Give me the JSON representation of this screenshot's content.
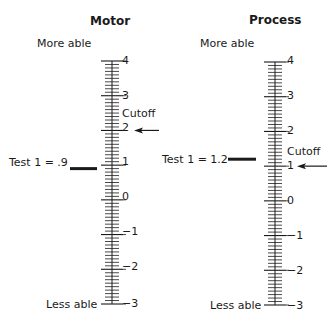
{
  "panels": [
    {
      "title": "Motor",
      "top_label": "More able",
      "bottom_label": "Less able",
      "scale": {
        "max": 4,
        "min": -3,
        "ticks": [
          "4",
          "3",
          "2",
          "1",
          "0",
          "−1",
          "−2",
          "−3"
        ]
      },
      "cutoff": {
        "label": "Cutoff",
        "value": 2
      },
      "measure": {
        "label": "Test 1 = .9",
        "value": 0.9
      }
    },
    {
      "title": "Process",
      "top_label": "More able",
      "bottom_label": "Less able",
      "scale": {
        "max": 4,
        "min": -3,
        "ticks": [
          "4",
          "3",
          "2",
          "1",
          "0",
          "−1",
          "−2",
          "−3"
        ]
      },
      "cutoff": {
        "label": "Cutoff",
        "value": 1
      },
      "measure": {
        "label": "Test 1 = 1.2",
        "value": 1.2
      }
    }
  ],
  "colors": {
    "ink": "#1a1a1a",
    "background": "#ffffff"
  }
}
